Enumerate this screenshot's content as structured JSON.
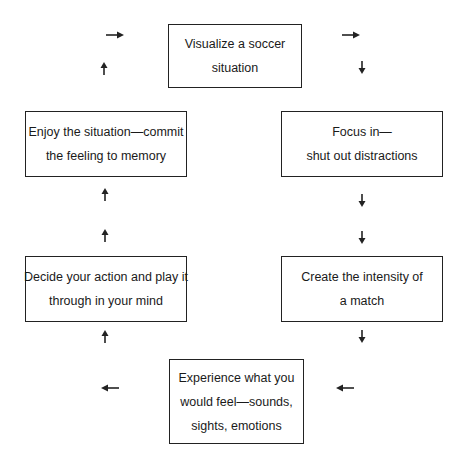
{
  "diagram": {
    "type": "cycle-flowchart",
    "nodes": [
      {
        "id": "visualize",
        "lines": [
          "Visualize a soccer",
          "situation"
        ]
      },
      {
        "id": "focus",
        "lines": [
          "Focus in—",
          "shut out distractions"
        ]
      },
      {
        "id": "intensity",
        "lines": [
          "Create the intensity of",
          "a match"
        ]
      },
      {
        "id": "experience",
        "lines": [
          "Experience what you",
          "would feel—sounds,",
          "sights, emotions"
        ]
      },
      {
        "id": "decide",
        "lines": [
          "Decide your action and play it",
          "through in your mind"
        ]
      },
      {
        "id": "enjoy",
        "lines": [
          "Enjoy the situation—commit",
          "the feeling to memory"
        ]
      }
    ],
    "edges": [
      {
        "from": "visualize",
        "to": "focus"
      },
      {
        "from": "focus",
        "to": "intensity"
      },
      {
        "from": "intensity",
        "to": "experience"
      },
      {
        "from": "experience",
        "to": "decide"
      },
      {
        "from": "decide",
        "to": "enjoy"
      },
      {
        "from": "enjoy",
        "to": "visualize"
      }
    ],
    "colors": {
      "stroke": "#222222",
      "background": "#ffffff"
    }
  }
}
